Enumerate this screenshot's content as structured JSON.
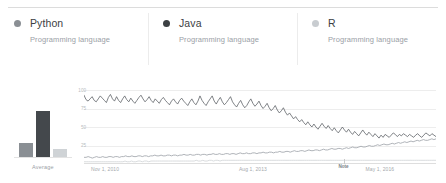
{
  "legend": {
    "items": [
      {
        "name": "Python",
        "subtitle": "Programming language",
        "color": "#8a8f94",
        "dot": "series-dot"
      },
      {
        "name": "Java",
        "subtitle": "Programming language",
        "color": "#3c4043",
        "dot": "series-dot"
      },
      {
        "name": "R",
        "subtitle": "Programming language",
        "color": "#c8ccd0",
        "dot": "series-dot"
      }
    ]
  },
  "average_chart": {
    "label": "Average",
    "bars": [
      {
        "series": "Python",
        "value": 22,
        "color": "#8a8f94"
      },
      {
        "series": "Java",
        "value": 73,
        "color": "#44484c"
      },
      {
        "series": "R",
        "value": 12,
        "color": "#cfd3d6"
      }
    ],
    "max": 100
  },
  "chart_data": {
    "type": "line",
    "title": "",
    "xlabel": "",
    "ylabel": "",
    "ylim": [
      0,
      100
    ],
    "yticks": [
      25,
      50,
      75,
      100
    ],
    "grid": true,
    "legend_position": "top",
    "xtick_labels": [
      "Nov 1, 2010",
      "Aug 1, 2013",
      "May 1, 2016"
    ],
    "xtick_positions": [
      0.02,
      0.44,
      0.8
    ],
    "annotations": [
      {
        "text": "Note",
        "x": 0.74,
        "y": 0
      }
    ],
    "series": [
      {
        "name": "Java",
        "color": "#5f6368",
        "values": [
          93,
          87,
          85,
          88,
          91,
          86,
          84,
          88,
          92,
          89,
          86,
          83,
          90,
          94,
          88,
          85,
          91,
          86,
          83,
          88,
          92,
          87,
          84,
          89,
          85,
          82,
          86,
          90,
          93,
          88,
          84,
          87,
          91,
          86,
          83,
          88,
          85,
          82,
          87,
          90,
          86,
          83,
          80,
          85,
          88,
          84,
          81,
          86,
          89,
          85,
          82,
          79,
          84,
          88,
          83,
          80,
          85,
          92,
          86,
          82,
          79,
          84,
          88,
          92,
          85,
          81,
          86,
          90,
          84,
          80,
          83,
          87,
          91,
          84,
          80,
          77,
          82,
          86,
          80,
          76,
          79,
          84,
          88,
          82,
          78,
          81,
          85,
          79,
          75,
          78,
          82,
          76,
          72,
          75,
          79,
          73,
          69,
          72,
          76,
          70,
          66,
          69,
          65,
          61,
          64,
          60,
          57,
          60,
          56,
          53,
          57,
          53,
          50,
          54,
          50,
          47,
          51,
          55,
          51,
          48,
          52,
          48,
          45,
          49,
          45,
          42,
          46,
          50,
          46,
          43,
          47,
          43,
          40,
          44,
          41,
          38,
          42,
          46,
          42,
          39,
          43,
          40,
          37,
          41,
          38,
          35,
          39,
          36,
          40,
          38,
          36,
          39,
          42,
          40,
          37,
          40,
          38,
          41,
          39,
          37,
          40,
          38,
          36,
          39,
          41,
          38,
          36,
          39,
          42,
          40,
          38,
          41,
          39,
          37
        ]
      },
      {
        "name": "Python",
        "color": "#9aa0a6",
        "values": [
          9,
          9,
          10,
          9,
          8,
          9,
          10,
          9,
          9,
          10,
          9,
          9,
          10,
          10,
          9,
          10,
          10,
          9,
          10,
          10,
          11,
          10,
          10,
          11,
          10,
          10,
          11,
          11,
          10,
          11,
          11,
          10,
          11,
          11,
          12,
          11,
          11,
          12,
          11,
          11,
          12,
          12,
          11,
          12,
          12,
          11,
          12,
          12,
          13,
          12,
          12,
          13,
          12,
          12,
          13,
          13,
          12,
          13,
          13,
          12,
          13,
          13,
          14,
          13,
          13,
          14,
          13,
          13,
          14,
          14,
          13,
          14,
          14,
          13,
          14,
          15,
          14,
          14,
          15,
          14,
          14,
          15,
          15,
          14,
          15,
          15,
          16,
          15,
          15,
          16,
          16,
          15,
          16,
          16,
          17,
          16,
          16,
          17,
          17,
          16,
          17,
          18,
          17,
          17,
          18,
          18,
          17,
          18,
          19,
          18,
          18,
          19,
          19,
          18,
          19,
          20,
          19,
          19,
          20,
          21,
          20,
          20,
          21,
          21,
          20,
          21,
          22,
          21,
          22,
          23,
          22,
          22,
          23,
          24,
          23,
          23,
          24,
          25,
          24,
          24,
          25,
          26,
          25,
          26,
          27,
          26,
          26,
          27,
          28,
          27,
          28,
          29,
          28,
          29,
          30,
          29,
          30,
          31,
          30,
          31,
          32,
          31,
          32,
          33,
          32,
          32,
          33,
          34,
          33,
          34
        ]
      },
      {
        "name": "R",
        "color": "#cfd3d6",
        "values": [
          3,
          3,
          3,
          3,
          3,
          3,
          3,
          3,
          3,
          3,
          3,
          3,
          3,
          3,
          3,
          3,
          3,
          3,
          3,
          4,
          3,
          3,
          4,
          3,
          3,
          4,
          4,
          3,
          4,
          4,
          3,
          4,
          4,
          4,
          4,
          4,
          4,
          4,
          4,
          4,
          4,
          4,
          4,
          4,
          4,
          4,
          4,
          4,
          4,
          4,
          4,
          4,
          5,
          4,
          4,
          5,
          4,
          4,
          5,
          5,
          4,
          5,
          5,
          4,
          5,
          5,
          5,
          5,
          5,
          5,
          5,
          5,
          5,
          5,
          5,
          5,
          5,
          5,
          5,
          5,
          5,
          5,
          5,
          5,
          5,
          5,
          5,
          5,
          5,
          5,
          5,
          5,
          5,
          5,
          5,
          5,
          5,
          5,
          5,
          5,
          5,
          5,
          5,
          5,
          5,
          5,
          5,
          5,
          5,
          5,
          5,
          5,
          5,
          5,
          5,
          5,
          5,
          5,
          5,
          5,
          5,
          5,
          5,
          5,
          5,
          5,
          5,
          5,
          5,
          5,
          5,
          5,
          5,
          5,
          5,
          5,
          5,
          5,
          5,
          5,
          5,
          5,
          5,
          5,
          5,
          5,
          5,
          5,
          5,
          5,
          5,
          5,
          5,
          5,
          5,
          5,
          5,
          5,
          5,
          5,
          5,
          5,
          5,
          5
        ]
      }
    ]
  }
}
